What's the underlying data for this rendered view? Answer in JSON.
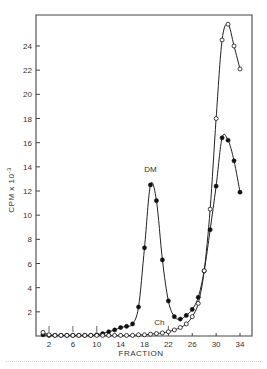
{
  "chart_data": {
    "type": "line",
    "title": "",
    "xlabel": "FRACTION",
    "ylabel": "CPM x 10^-3",
    "ylabel_display": "CPM x 10",
    "ylabel_exponent": "-3",
    "xlim": [
      1,
      34
    ],
    "ylim": [
      0,
      26
    ],
    "xticks": [
      2,
      6,
      10,
      14,
      18,
      22,
      26,
      30,
      34
    ],
    "yticks": [
      2,
      4,
      6,
      8,
      10,
      12,
      14,
      16,
      18,
      20,
      22,
      24
    ],
    "grid": false,
    "legend": "none (inline annotations)",
    "annotations": [
      {
        "text": "DM",
        "x": 19,
        "y": 13.6,
        "series": "DM"
      },
      {
        "text": "Ch",
        "x": 20.5,
        "y": 0.9,
        "series": "Ch"
      }
    ],
    "x": [
      1,
      2,
      3,
      4,
      5,
      6,
      7,
      8,
      9,
      10,
      11,
      12,
      13,
      14,
      15,
      16,
      17,
      18,
      19,
      20,
      21,
      22,
      23,
      24,
      25,
      26,
      27,
      28,
      29,
      30,
      31,
      32,
      33,
      34
    ],
    "series": [
      {
        "name": "DM",
        "marker": "filled-circle",
        "color": "#111111",
        "values": [
          0.1,
          0.05,
          0.05,
          0.05,
          0.05,
          0.05,
          0.05,
          0.05,
          0.05,
          0.1,
          0.2,
          0.35,
          0.5,
          0.7,
          0.8,
          1.0,
          2.4,
          7.3,
          12.5,
          11.2,
          6.3,
          2.9,
          1.6,
          1.4,
          1.7,
          2.2,
          3.2,
          5.4,
          8.8,
          12.4,
          16.4,
          16.2,
          14.5,
          11.9
        ]
      },
      {
        "name": "Ch",
        "marker": "open-circle",
        "color": "#111111",
        "values": [
          0.3,
          0.1,
          0.05,
          0.05,
          0.05,
          0.05,
          0.05,
          0.05,
          0.05,
          0.05,
          0.05,
          0.05,
          0.05,
          0.05,
          0.05,
          0.05,
          0.1,
          0.1,
          0.15,
          0.2,
          0.25,
          0.35,
          0.5,
          0.7,
          1.0,
          1.6,
          2.7,
          5.4,
          10.5,
          18.0,
          24.5,
          25.8,
          24.0,
          22.1
        ]
      }
    ],
    "tick_marks_on_baseline": [
      2,
      6,
      10,
      22
    ]
  },
  "colors": {
    "axis": "#444444",
    "line": "#222222",
    "background": "#ffffff"
  }
}
